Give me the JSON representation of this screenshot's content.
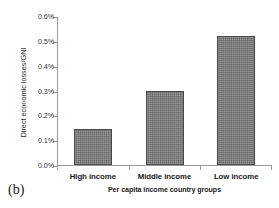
{
  "figure": {
    "panel_label": "(b)"
  },
  "chart_data": {
    "type": "bar",
    "title": "",
    "subtitle": "",
    "xlabel": "Per capita income country groups",
    "ylabel": "Direct economic losses/GNI",
    "categories": [
      "High income",
      "Middle income",
      "Low income"
    ],
    "values": [
      0.145,
      0.3,
      0.52
    ],
    "value_unit": "%",
    "ylim": [
      0.0,
      0.6
    ],
    "ytick_values": [
      0.0,
      0.1,
      0.2,
      0.3,
      0.4,
      0.5,
      0.6
    ],
    "ytick_labels": [
      "0.0%",
      "0.1%",
      "0.2%",
      "0.3%",
      "0.4%",
      "0.5%",
      "0.6%"
    ],
    "grid": false,
    "legend": null,
    "legend_position": "none",
    "bar_color": "#7f7f7f",
    "bar_edge_color": "#4a4a4a",
    "axis_color": "#9a9a9a",
    "background_color": "#ffffff",
    "annotations": []
  }
}
